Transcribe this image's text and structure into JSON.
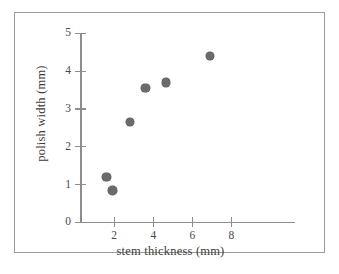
{
  "figure": {
    "background_color": "#ffffff",
    "border_color": "#9a9a9a",
    "caption": ""
  },
  "chart_data": {
    "type": "scatter",
    "title": "",
    "xlabel": "stem thickness (mm)",
    "ylabel": "polish width (mm)",
    "xlim": [
      0.25,
      11.25
    ],
    "ylim": [
      0,
      5
    ],
    "xticks": [
      2,
      4,
      6,
      8
    ],
    "yticks": [
      0,
      1,
      2,
      3,
      4,
      5
    ],
    "xtick_labels": [
      "2",
      "4",
      "6",
      "8"
    ],
    "ytick_labels": [
      "0",
      "1",
      "2",
      "3",
      "4",
      "5"
    ],
    "grid": false,
    "legend": null,
    "marker": {
      "shape": "circle",
      "color": "#6b6b6b",
      "size_px": 8.5
    },
    "points": [
      {
        "x": 1.6,
        "y": 1.2
      },
      {
        "x": 1.9,
        "y": 0.85
      },
      {
        "x": 2.8,
        "y": 2.65
      },
      {
        "x": 3.6,
        "y": 3.55
      },
      {
        "x": 4.65,
        "y": 3.7
      },
      {
        "x": 6.9,
        "y": 4.4
      }
    ]
  }
}
